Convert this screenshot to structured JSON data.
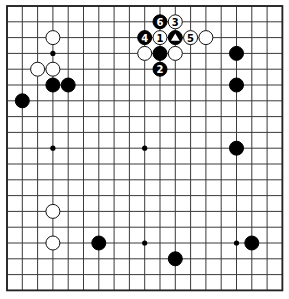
{
  "board": {
    "size": 19,
    "origin_x": 7,
    "origin_y": 6,
    "spacing_x": 15.3,
    "spacing_y": 15.8,
    "stone_radius": 7,
    "colors": {
      "line": "#3a3a3a",
      "black": "#000000",
      "white": "#ffffff",
      "background": "#ffffff"
    },
    "star_points": [
      {
        "col": 3,
        "row": 3
      },
      {
        "col": 9,
        "row": 3
      },
      {
        "col": 15,
        "row": 3
      },
      {
        "col": 3,
        "row": 9
      },
      {
        "col": 9,
        "row": 9
      },
      {
        "col": 15,
        "row": 9
      },
      {
        "col": 3,
        "row": 15
      },
      {
        "col": 9,
        "row": 15
      },
      {
        "col": 15,
        "row": 15
      }
    ],
    "stones": [
      {
        "col": 3,
        "row": 2,
        "color": "white",
        "label": ""
      },
      {
        "col": 2,
        "row": 4,
        "color": "white",
        "label": ""
      },
      {
        "col": 3,
        "row": 4,
        "color": "white",
        "label": ""
      },
      {
        "col": 3,
        "row": 5,
        "color": "black",
        "label": ""
      },
      {
        "col": 4,
        "row": 5,
        "color": "black",
        "label": ""
      },
      {
        "col": 1,
        "row": 6,
        "color": "black",
        "label": ""
      },
      {
        "col": 10,
        "row": 1,
        "color": "black",
        "label": "6"
      },
      {
        "col": 11,
        "row": 1,
        "color": "white",
        "label": "3"
      },
      {
        "col": 9,
        "row": 2,
        "color": "black",
        "label": "4"
      },
      {
        "col": 10,
        "row": 2,
        "color": "white",
        "label": "1"
      },
      {
        "col": 11,
        "row": 2,
        "color": "black",
        "label": "▲"
      },
      {
        "col": 12,
        "row": 2,
        "color": "white",
        "label": "5"
      },
      {
        "col": 13,
        "row": 2,
        "color": "white",
        "label": ""
      },
      {
        "col": 9,
        "row": 3,
        "color": "white",
        "label": ""
      },
      {
        "col": 10,
        "row": 3,
        "color": "black",
        "label": ""
      },
      {
        "col": 11,
        "row": 3,
        "color": "white",
        "label": ""
      },
      {
        "col": 10,
        "row": 4,
        "color": "black",
        "label": "2"
      },
      {
        "col": 15,
        "row": 3,
        "color": "black",
        "label": ""
      },
      {
        "col": 15,
        "row": 5,
        "color": "black",
        "label": ""
      },
      {
        "col": 15,
        "row": 9,
        "color": "black",
        "label": ""
      },
      {
        "col": 3,
        "row": 13,
        "color": "white",
        "label": ""
      },
      {
        "col": 3,
        "row": 15,
        "color": "white",
        "label": ""
      },
      {
        "col": 6,
        "row": 15,
        "color": "black",
        "label": ""
      },
      {
        "col": 11,
        "row": 16,
        "color": "black",
        "label": ""
      },
      {
        "col": 16,
        "row": 15,
        "color": "black",
        "label": ""
      }
    ]
  }
}
